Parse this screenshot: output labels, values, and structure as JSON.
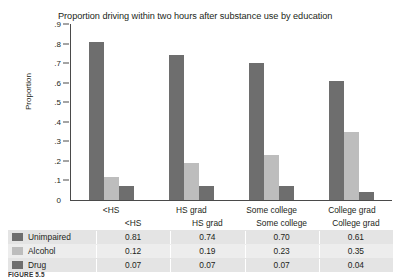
{
  "chart_data": {
    "type": "bar",
    "title": "Proportion driving within two hours after substance use by education",
    "xlabel": "",
    "ylabel": "Proportion",
    "categories": [
      "<HS",
      "HS grad",
      "Some college",
      "College grad"
    ],
    "series": [
      {
        "name": "Unimpaired",
        "values": [
          0.81,
          0.74,
          0.7,
          0.61
        ],
        "color": "#6e6e6e"
      },
      {
        "name": "Alcohol",
        "values": [
          0.12,
          0.19,
          0.23,
          0.35
        ],
        "color": "#bdbdbd"
      },
      {
        "name": "Drug",
        "values": [
          0.07,
          0.07,
          0.07,
          0.04
        ],
        "color": "#6e6e6e"
      }
    ],
    "ylim": [
      0,
      0.9
    ],
    "yticks": [
      0,
      0.1,
      0.2,
      0.3,
      0.4,
      0.5,
      0.6,
      0.7,
      0.8,
      0.9
    ],
    "ytick_labels": [
      "0",
      ".1",
      ".2",
      ".3",
      ".4",
      ".5",
      ".6",
      ".7",
      ".8",
      ".9"
    ],
    "grid": false,
    "legend_position": "table-below"
  },
  "table": {
    "columns": [
      "<HS",
      "HS grad",
      "Some college",
      "College grad"
    ],
    "rows": [
      {
        "label": "Unimpaired",
        "values": [
          "0.81",
          "0.74",
          "0.70",
          "0.61"
        ],
        "swatch": "#6e6e6e"
      },
      {
        "label": "Alcohol",
        "values": [
          "0.12",
          "0.19",
          "0.23",
          "0.35"
        ],
        "swatch": "#bdbdbd"
      },
      {
        "label": "Drug",
        "values": [
          "0.07",
          "0.07",
          "0.07",
          "0.04"
        ],
        "swatch": "#6e6e6e"
      }
    ]
  },
  "caption": {
    "figure_number": "FIGURE 5.5",
    "text": ""
  }
}
